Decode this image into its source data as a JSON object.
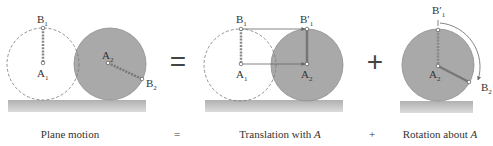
{
  "figure": {
    "colors": {
      "body_fill": "#a9a9a9",
      "body_stroke": "#8e8e8e",
      "ghost_stroke": "#777777",
      "ground_top": "#b5b5b5",
      "ground_bottom": "#d8d8d8",
      "line": "#7a7a7a",
      "text": "#333333"
    },
    "operators": {
      "equals": "=",
      "plus": "+"
    },
    "panels": [
      {
        "name": "plane-motion",
        "caption": "Plane motion",
        "labels": {
          "B1": "B",
          "B1_sub": "1",
          "A1": "A",
          "A1_sub": "1",
          "A2": "A",
          "A2_sub": "2",
          "B2": "B",
          "B2_sub": "2"
        }
      },
      {
        "name": "translation",
        "caption_prefix": "Translation with ",
        "caption_var": "A",
        "labels": {
          "B1": "B",
          "B1_sub": "1",
          "A1": "A",
          "A1_sub": "1",
          "A2": "A",
          "A2_sub": "2",
          "B1p": "B′",
          "B1p_sub": "1"
        }
      },
      {
        "name": "rotation",
        "caption_prefix": "Rotation about ",
        "caption_var": "A",
        "labels": {
          "A2": "A",
          "A2_sub": "2",
          "B1p": "B′",
          "B1p_sub": "1",
          "B2": "B",
          "B2_sub": "2"
        }
      }
    ],
    "captions_equals": "=",
    "captions_plus": "+"
  }
}
